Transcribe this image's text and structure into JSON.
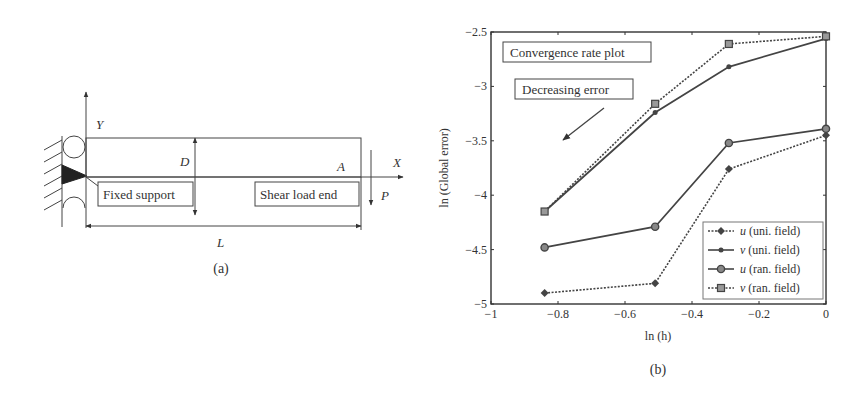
{
  "figure_a": {
    "caption": "(a)",
    "labels": {
      "y_axis": "Y",
      "x_axis": "X",
      "depth": "D",
      "point": "A",
      "load": "P",
      "length": "L"
    },
    "boxes": {
      "fixed_support": "Fixed support",
      "shear_load_end": "Shear load end"
    }
  },
  "figure_b": {
    "caption": "(b)",
    "annotations": {
      "title_box": "Convergence rate plot",
      "arrow_box": "Decreasing error"
    },
    "legend": [
      {
        "var": "u",
        "label": " (uni. field)",
        "style": "dotted",
        "marker": "diamond"
      },
      {
        "var": "v",
        "label": " (uni. field)",
        "style": "solid",
        "marker": "dot"
      },
      {
        "var": "u",
        "label": " (ran. field)",
        "style": "solid",
        "marker": "circle"
      },
      {
        "var": "v",
        "label": " (ran. field)",
        "style": "dotted",
        "marker": "square"
      }
    ]
  },
  "chart_data": {
    "type": "line",
    "title": "Convergence rate plot",
    "xlabel": "ln (h)",
    "ylabel": "ln (Global error)",
    "xlim": [
      -1,
      0
    ],
    "ylim": [
      -5,
      -2.5
    ],
    "xticks": [
      -1,
      -0.8,
      -0.6,
      -0.4,
      -0.2,
      0
    ],
    "xtick_labels": [
      "−1",
      "−0.8",
      "−0.6",
      "−0.4",
      "−0.2",
      "0"
    ],
    "yticks": [
      -2.5,
      -3,
      -3.5,
      -4,
      -4.5,
      -5
    ],
    "ytick_labels": [
      "−2.5",
      "−3",
      "−3.5",
      "−4",
      "−4.5",
      "−5"
    ],
    "grid": false,
    "legend_position": "lower right",
    "annotations": [
      "Convergence rate plot",
      "Decreasing error"
    ],
    "x": [
      -0.84,
      -0.51,
      -0.29,
      0
    ],
    "series": [
      {
        "name": "u (uni. field)",
        "values": [
          -4.9,
          -4.81,
          -3.76,
          -3.45
        ]
      },
      {
        "name": "v (uni. field)",
        "values": [
          -4.15,
          -3.24,
          -2.82,
          -2.56
        ]
      },
      {
        "name": "u (ran. field)",
        "values": [
          -4.48,
          -4.29,
          -3.52,
          -3.39
        ]
      },
      {
        "name": "v (ran. field)",
        "values": [
          -4.15,
          -3.16,
          -2.61,
          -2.54
        ]
      }
    ]
  }
}
